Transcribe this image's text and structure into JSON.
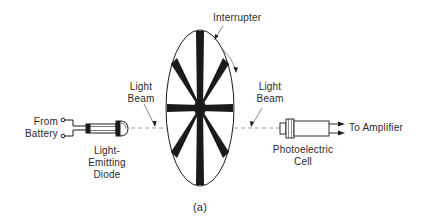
{
  "figure": {
    "caption": "(a)",
    "labels": {
      "interrupter": "Interrupter",
      "light_beam_left_line1": "Light",
      "light_beam_left_line2": "Beam",
      "light_beam_right_line1": "Light",
      "light_beam_right_line2": "Beam",
      "from_battery_line1": "From",
      "from_battery_line2": "Battery",
      "led_line1": "Light-",
      "led_line2": "Emitting",
      "led_line3": "Diode",
      "photo_line1": "Photoelectric",
      "photo_line2": "Cell",
      "to_amplifier": "To Amplifier"
    },
    "components": [
      "battery-terminals",
      "light-emitting-diode",
      "light-beam",
      "interrupter-disk",
      "photoelectric-cell",
      "amplifier-output"
    ],
    "interrupter": {
      "spokes": 8
    },
    "colors": {
      "ink": "#1a1a1a",
      "label": "#2a2a2a",
      "beam": "#8a8a8a",
      "background": "#ffffff"
    }
  }
}
